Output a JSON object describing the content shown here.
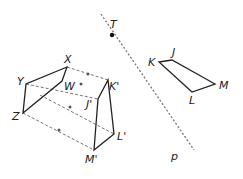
{
  "diagram": {
    "line": {
      "label": "p",
      "point_label": "T"
    },
    "preimage": {
      "vertices": [
        "J",
        "K",
        "L",
        "M"
      ]
    },
    "image": {
      "vertices": [
        "J'",
        "K'",
        "L'",
        "M'"
      ]
    },
    "other_quad": {
      "vertices": [
        "W",
        "X",
        "Y",
        "Z"
      ]
    },
    "labels": {
      "T": "T",
      "p": "p",
      "J": "J",
      "K": "K",
      "L": "L",
      "M": "M",
      "Jp": "J'",
      "Kp": "K'",
      "Lp": "L'",
      "Mp": "M'",
      "W": "W",
      "X": "X",
      "Y": "Y",
      "Z": "Z"
    },
    "colors": {
      "stroke": "#222222",
      "dashed": "#666666"
    }
  }
}
